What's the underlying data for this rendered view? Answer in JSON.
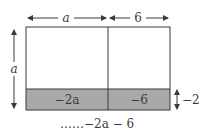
{
  "diagram": {
    "top_labels": {
      "left_width": "a",
      "right_width": "6"
    },
    "side_label": "a",
    "cells": {
      "bottom_left": "−2a",
      "bottom_right": "−6"
    },
    "band_label": "−2",
    "footer": "……−2a − 6",
    "colors": {
      "stroke": "#3a3a3a",
      "band_fill": "#a9a9a9",
      "background": "#ffffff"
    }
  }
}
